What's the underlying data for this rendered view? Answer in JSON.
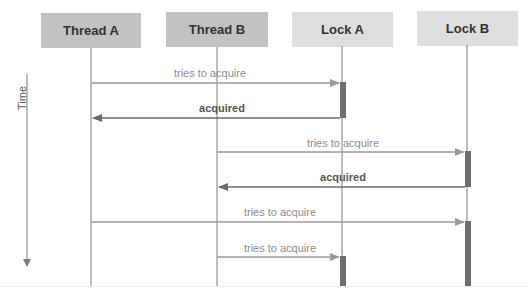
{
  "diagram": {
    "type": "sequence",
    "time_axis": {
      "label": "Time",
      "direction": "down"
    },
    "participants": [
      {
        "id": "thread_a",
        "label": "Thread A",
        "kind": "thread",
        "color": "#c2c2c2"
      },
      {
        "id": "thread_b",
        "label": "Thread B",
        "kind": "thread",
        "color": "#c2c2c2"
      },
      {
        "id": "lock_a",
        "label": "Lock A",
        "kind": "lock",
        "color": "#dedede"
      },
      {
        "id": "lock_b",
        "label": "Lock B",
        "kind": "lock",
        "color": "#dedede"
      }
    ],
    "messages": [
      {
        "from": "Thread A",
        "to": "Lock A",
        "label": "tries to acquire",
        "kind": "request"
      },
      {
        "from": "Lock A",
        "to": "Thread A",
        "label": "acquired",
        "kind": "reply"
      },
      {
        "from": "Thread B",
        "to": "Lock B",
        "label": "tries to acquire",
        "kind": "request"
      },
      {
        "from": "Lock B",
        "to": "Thread B",
        "label": "acquired",
        "kind": "reply"
      },
      {
        "from": "Thread A",
        "to": "Lock B",
        "label": "tries to acquire",
        "kind": "request"
      },
      {
        "from": "Thread B",
        "to": "Lock A",
        "label": "tries to acquire",
        "kind": "request"
      }
    ],
    "colors": {
      "request_arrow": "#9a9a9a",
      "reply_arrow": "#6a6a6a",
      "lifeline": "#7a7a7a",
      "activation": "#6e6e6e"
    }
  }
}
